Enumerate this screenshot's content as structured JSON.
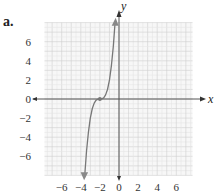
{
  "problem_label": "a.",
  "chart_data": {
    "type": "line",
    "title": "",
    "xlabel": "x",
    "ylabel": "y",
    "xlim": [
      -8,
      8
    ],
    "ylim": [
      -8,
      8
    ],
    "grid": true,
    "x_ticks": [
      "−6",
      "−4",
      "−2",
      "0",
      "2",
      "4",
      "6"
    ],
    "y_ticks": [
      "6",
      "4",
      "2",
      "0",
      "−2",
      "−4",
      "−6"
    ],
    "series": [
      {
        "name": "cubic curve",
        "description": "Cubic with inflection point at (-2, 0); arrows at both ends",
        "x": [
          -3.6,
          -3.4,
          -3.2,
          -3.0,
          -2.8,
          -2.6,
          -2.4,
          -2.2,
          -2.0,
          -1.8,
          -1.6,
          -1.4,
          -1.2,
          -1.0,
          -0.8,
          -0.6,
          -0.4
        ],
        "y": [
          -8.2,
          -5.5,
          -3.5,
          -2.0,
          -1.0,
          -0.43,
          -0.13,
          -0.02,
          0,
          0.02,
          0.13,
          0.43,
          1.0,
          2.0,
          3.5,
          5.5,
          8.2
        ]
      }
    ],
    "points": [
      {
        "x": -2,
        "y": 0,
        "label": "inflection point"
      }
    ],
    "colors": {
      "curve": "#777777",
      "axis": "#555555",
      "grid_major": "#cfcfcf",
      "grid_minor": "#e6e6e6"
    }
  }
}
